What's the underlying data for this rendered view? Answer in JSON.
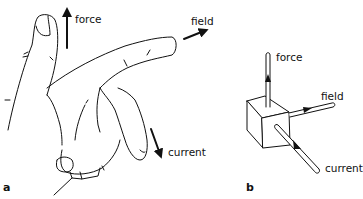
{
  "panels": {
    "a": {
      "letter": "a",
      "subject": "right hand",
      "labels": {
        "force": "force",
        "field": "field",
        "current": "current"
      }
    },
    "b": {
      "letter": "b",
      "subject": "cube with three orthogonal rods",
      "labels": {
        "force": "force",
        "field": "field",
        "current": "current"
      }
    }
  },
  "colors": {
    "ink": "#111111",
    "background": "#ffffff"
  }
}
